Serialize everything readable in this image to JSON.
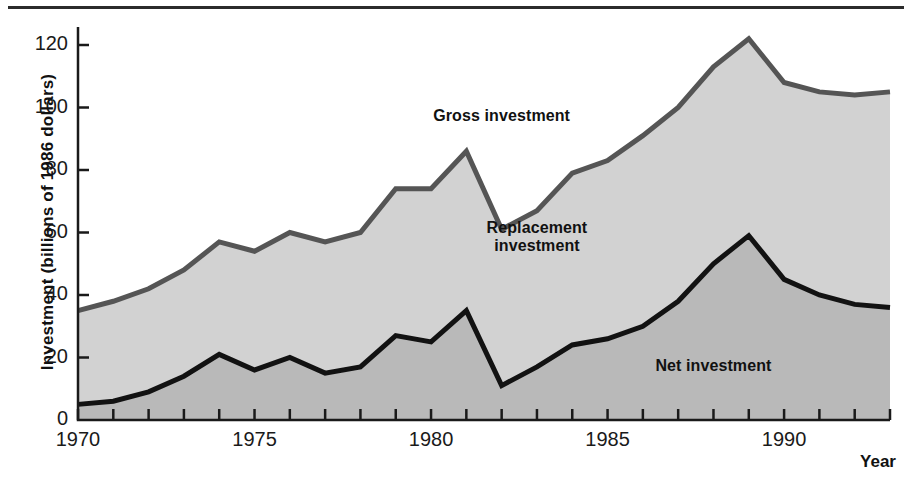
{
  "chart_data": {
    "type": "area",
    "title": "",
    "xlabel": "Year",
    "ylabel": "Investment (billions of 1986 dollars)",
    "xlim": [
      1970,
      1993
    ],
    "ylim": [
      0,
      128
    ],
    "grid": false,
    "legend_position": "inline-annotations",
    "x": [
      1970,
      1971,
      1972,
      1973,
      1974,
      1975,
      1976,
      1977,
      1978,
      1979,
      1980,
      1981,
      1982,
      1983,
      1984,
      1985,
      1986,
      1987,
      1988,
      1989,
      1990,
      1991,
      1992,
      1993
    ],
    "xticks": [
      1970,
      1975,
      1980,
      1985,
      1990
    ],
    "xtick_labels": [
      "1970",
      "1975",
      "1980",
      "1985",
      "1990"
    ],
    "yticks": [
      0,
      20,
      40,
      60,
      80,
      100,
      120
    ],
    "ytick_labels": [
      "0",
      "20",
      "40",
      "60",
      "80",
      "100",
      "120"
    ],
    "minor_xticks_every": 1,
    "series": [
      {
        "name": "Gross investment",
        "values": [
          35,
          38,
          42,
          48,
          57,
          54,
          60,
          57,
          60,
          74,
          74,
          86,
          61,
          67,
          79,
          83,
          91,
          100,
          113,
          122,
          108,
          105,
          104,
          105
        ],
        "line_color": "#555555",
        "fill_color": "#d2d2d2"
      },
      {
        "name": "Net investment",
        "values": [
          5,
          6,
          9,
          14,
          21,
          16,
          20,
          15,
          17,
          27,
          25,
          35,
          11,
          17,
          24,
          26,
          30,
          38,
          50,
          59,
          45,
          40,
          37,
          36
        ],
        "line_color": "#121212",
        "fill_color": "#b9b9b9"
      }
    ],
    "band_between": {
      "name": "Replacement investment",
      "description": "Region between the Net investment curve and the Gross investment curve",
      "fill_color": "#d2d2d2"
    },
    "annotations": [
      {
        "text": "Gross investment",
        "x": 1982.0,
        "y": 97,
        "name": "gross-investment-label"
      },
      {
        "text": "Replacement investment",
        "x": 1983.0,
        "y": 58,
        "name": "replacement-investment-label"
      },
      {
        "text": "Net investment",
        "x": 1988.0,
        "y": 17,
        "name": "net-investment-label"
      }
    ]
  },
  "axis": {
    "y_title": "Investment (billions of 1986 dollars)",
    "x_title": "Year"
  },
  "labels": {
    "gross": "Gross investment",
    "replacement_line1": "Replacement",
    "replacement_line2": "investment",
    "net": "Net investment"
  },
  "colors": {
    "gross_line": "#555555",
    "net_line": "#121212",
    "replacement_fill": "#d2d2d2",
    "net_fill": "#b9b9b9",
    "axis": "#1a1a1a",
    "text": "#111111"
  }
}
